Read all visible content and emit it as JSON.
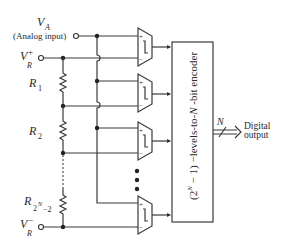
{
  "diagram": {
    "inputs": {
      "va_label": "V",
      "va_sub": "A",
      "va_desc": "(Analog input)",
      "vr_plus_label": "V",
      "vr_plus_sup": "+",
      "vr_plus_sub": "R",
      "vr_minus_label": "V",
      "vr_minus_sup": "−",
      "vr_minus_sub": "R"
    },
    "resistors": [
      {
        "label": "R",
        "sub": "1"
      },
      {
        "label": "R",
        "sub": "2"
      },
      {
        "label": "R",
        "sub": "2",
        "sub_sup": "N",
        "sub_tail": "−2"
      }
    ],
    "comparators": {
      "count_visible": 4,
      "plus_sign": "+",
      "minus_sign": "−",
      "ellipsis": "⋮"
    },
    "encoder": {
      "label_prefix": "(2",
      "label_sup": "N",
      "label_suffix": " − 1) −levels-to-",
      "label_n": "N",
      "label_end": " -bit encoder"
    },
    "output": {
      "bus_label": "N",
      "line1": "Digital",
      "line2": "output"
    }
  }
}
